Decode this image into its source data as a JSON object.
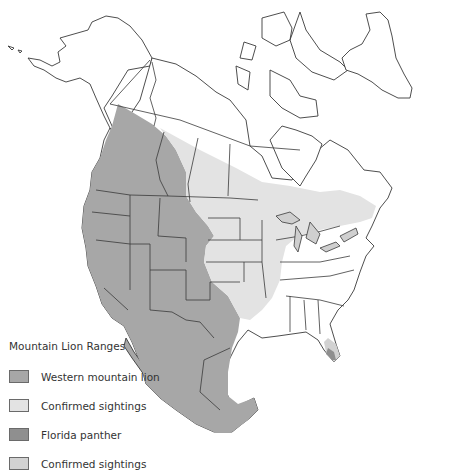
{
  "map": {
    "subject": "North America mountain lion range map",
    "colors": {
      "land": "#ffffff",
      "outline": "#3a3a3a",
      "western_mountain_lion": "#a7a7a7",
      "western_confirmed_sightings": "#e3e3e3",
      "florida_panther": "#8f8f8f",
      "florida_confirmed_sightings": "#d2d2d2"
    }
  },
  "legend": {
    "title": "Mountain Lion Ranges",
    "items": [
      {
        "label": "Western mountain lion",
        "color": "#a7a7a7"
      },
      {
        "label": "Confirmed sightings",
        "color": "#e3e3e3"
      },
      {
        "label": "Florida panther",
        "color": "#8f8f8f"
      },
      {
        "label": "Confirmed sightings",
        "color": "#d2d2d2"
      }
    ]
  }
}
